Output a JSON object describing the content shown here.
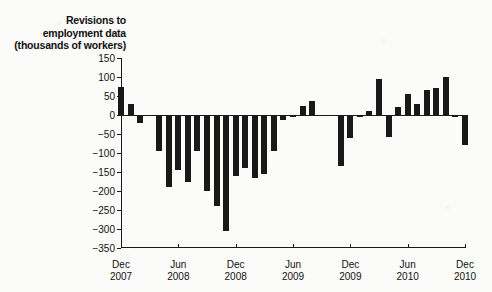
{
  "chart_data": {
    "type": "bar",
    "title": "Revisions to employment data (thousands of workers)",
    "title_lines": [
      "Revisions to",
      "employment data",
      "(thousands of workers)"
    ],
    "xlabel": "",
    "ylabel": "Revisions to employment data (thousands of workers)",
    "ylim": [
      -350,
      150
    ],
    "ytick_step": 50,
    "yticks": [
      150,
      100,
      50,
      0,
      -50,
      -100,
      -150,
      -200,
      -250,
      -300,
      -350
    ],
    "ytick_labels": [
      "150",
      "100",
      "50",
      "0",
      "−50",
      "−100",
      "−150",
      "−200",
      "−250",
      "−300",
      "−350"
    ],
    "grid": false,
    "legend": false,
    "bar_color": "#191919",
    "axis_color": "#1a1a1a",
    "xticks": [
      {
        "index": 0,
        "line1": "Dec",
        "line2": "2007"
      },
      {
        "index": 6,
        "line1": "Jun",
        "line2": "2008"
      },
      {
        "index": 12,
        "line1": "Dec",
        "line2": "2008"
      },
      {
        "index": 18,
        "line1": "Jun",
        "line2": "2009"
      },
      {
        "index": 24,
        "line1": "Dec",
        "line2": "2009"
      },
      {
        "index": 30,
        "line1": "Jun",
        "line2": "2010"
      },
      {
        "index": 36,
        "line1": "Dec",
        "line2": "2010"
      }
    ],
    "categories": [
      "Dec 2007",
      "Jan 2008",
      "Feb 2008",
      "Mar 2008",
      "Apr 2008",
      "May 2008",
      "Jun 2008",
      "Jul 2008",
      "Aug 2008",
      "Sep 2008",
      "Oct 2008",
      "Nov 2008",
      "Dec 2008",
      "Jan 2009",
      "Feb 2009",
      "Mar 2009",
      "Apr 2009",
      "May 2009",
      "Jun 2009",
      "Jul 2009",
      "Aug 2009",
      "Sep 2009",
      "Oct 2009",
      "Nov 2009",
      "Dec 2009",
      "Jan 2010",
      "Feb 2010",
      "Mar 2010",
      "Apr 2010",
      "May 2010",
      "Jun 2010",
      "Jul 2010",
      "Aug 2010",
      "Sep 2010",
      "Oct 2010",
      "Nov 2010",
      "Dec 2010"
    ],
    "values": [
      75,
      30,
      -22,
      -3,
      -95,
      -190,
      -145,
      -175,
      -95,
      -200,
      -240,
      -305,
      -160,
      -140,
      -165,
      -155,
      -95,
      -12,
      -5,
      25,
      38,
      -3,
      -2,
      -135,
      -60,
      -5,
      10,
      95,
      -58,
      20,
      55,
      28,
      65,
      72,
      100,
      -4,
      -80
    ]
  }
}
